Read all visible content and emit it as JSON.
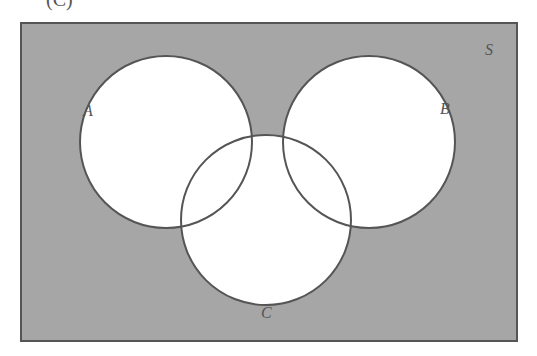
{
  "part_label": "(C)",
  "diagram": {
    "type": "venn",
    "universe_label": "S",
    "sets": [
      {
        "label": "A",
        "cx": 166,
        "cy": 142,
        "r": 86
      },
      {
        "label": "B",
        "cx": 369,
        "cy": 142,
        "r": 86
      },
      {
        "label": "C",
        "cx": 266,
        "cy": 220,
        "r": 85
      }
    ],
    "shaded_region": "complement of (A ∪ B ∪ C) in S",
    "colors": {
      "shade": "#a6a6a6",
      "border": "#555555",
      "circle_fill": "#ffffff"
    }
  }
}
